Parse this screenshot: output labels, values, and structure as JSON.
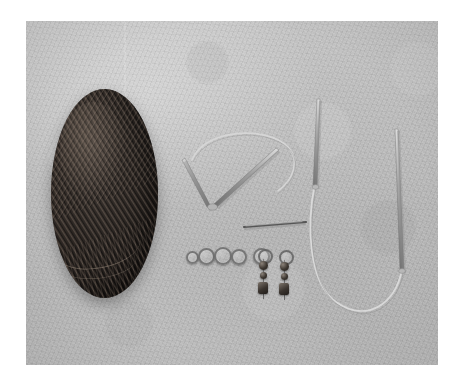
{
  "image": {
    "kind": "photograph",
    "subject": "Knitting supplies laid out on a light gray textured surface",
    "alt_text": "A dark brown oval ball of yarn on the left, with circular knitting needles, a cable needle, five metal ring stitch markers and two beaded dangle stitch markers arranged on a pale gray fabric background.",
    "border_color": "#ffffff",
    "background_color": "#bdbdbd",
    "photo_frame": {
      "left": 26,
      "top": 21,
      "width": 412,
      "height": 344
    }
  },
  "objects": [
    {
      "id": "yarn-ball",
      "label": "Ball of yarn",
      "description": "Large oval center-pull ball of dark brown wool with visible diagonal strand winding",
      "color": "#332d29",
      "highlight_color": "#96847 6",
      "position": {
        "left": 51,
        "top": 89,
        "width": 107,
        "height": 209
      }
    },
    {
      "id": "circular-needle-v",
      "label": "Circular knitting needle (V arrangement)",
      "description": "Two pointed metal needle tips angled into a V with a clear nylon cable looping above",
      "color": "#8f8f8f"
    },
    {
      "id": "circular-needle-u",
      "label": "Circular knitting needle (U arrangement)",
      "description": "Two upright metal needle tips joined by a clear cable that loops down into a U",
      "color": "#8f8f8f"
    },
    {
      "id": "cable-needle",
      "label": "Cable needle",
      "description": "Short straight metal needle lying horizontally",
      "color": "#6f6f6f"
    },
    {
      "id": "ring-markers",
      "label": "Ring stitch markers",
      "description": "A row of five small metal split rings",
      "count": 5,
      "color": "#6c6c6c"
    },
    {
      "id": "dangle-markers",
      "label": "Beaded dangle stitch markers",
      "description": "Two hanging stitch markers, each a ring with dark beads and a square charm",
      "count": 2,
      "bead_color": "#3c3630"
    }
  ],
  "ring_markers": [
    {
      "left": 186,
      "top": 251,
      "size": 9
    },
    {
      "left": 198,
      "top": 248,
      "size": 13
    },
    {
      "left": 213,
      "top": 247,
      "size": 14
    },
    {
      "left": 230,
      "top": 249,
      "size": 12
    },
    {
      "left": 252,
      "top": 248,
      "size": 13
    }
  ],
  "dangle_markers": [
    {
      "left": 258,
      "top": 250
    },
    {
      "left": 277,
      "top": 251
    }
  ]
}
